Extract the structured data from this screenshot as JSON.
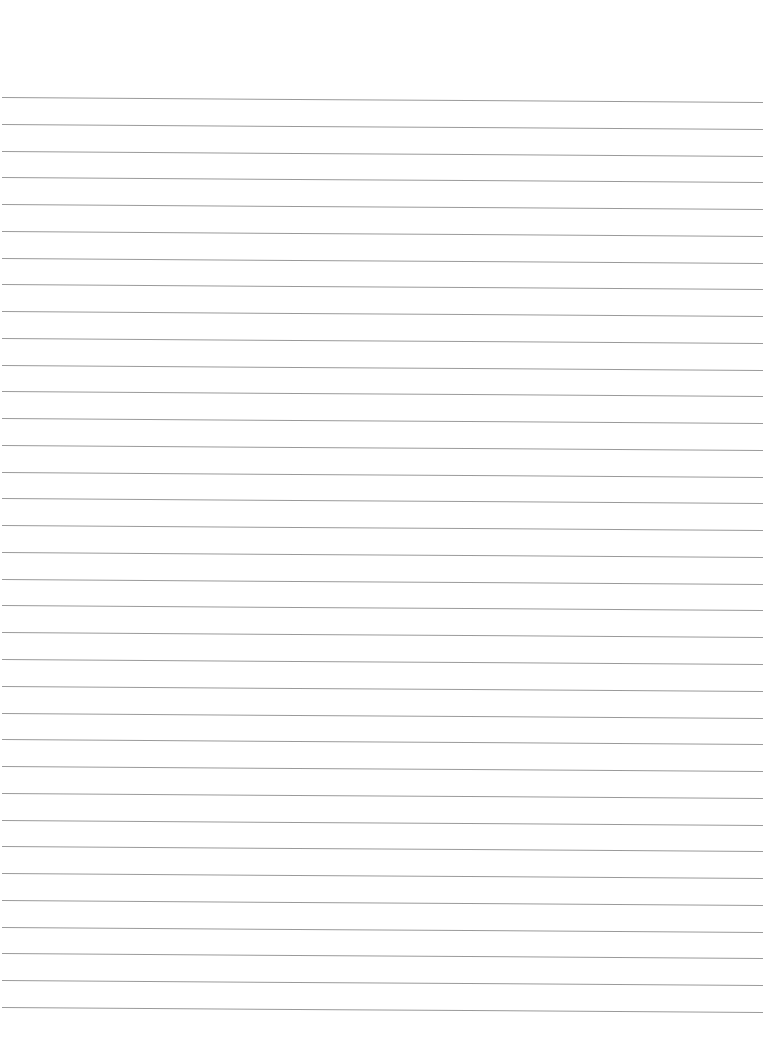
{
  "document": {
    "type": "lined-paper",
    "background_color": "#ffffff",
    "line_color": "#9a9a9a",
    "line_count": 35,
    "first_line_y": 97,
    "line_spacing": 26.76,
    "line_left_x": 2,
    "line_right_x": 763,
    "line_slope_px": 5,
    "text_content": []
  }
}
